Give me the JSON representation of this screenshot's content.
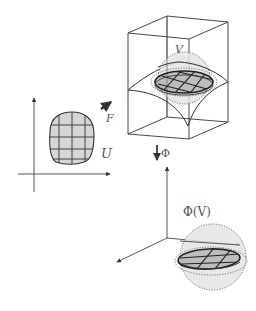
{
  "diagram": {
    "labels": {
      "domain_set": "U",
      "map_F": "F",
      "image_set_V": "V",
      "map_Phi": "Φ",
      "phi_of_V": "Φ(V)"
    },
    "colors": {
      "stroke": "#333333",
      "fill_region": "#d6d6d6",
      "sphere_fill": "#e4e4e4",
      "dotted": "#555555",
      "background": "#ffffff"
    },
    "parts": [
      "2D coordinate axes with grid-patch region U",
      "arrow F to 3D box",
      "3D box with curved surface containing patch V inside dotted sphere",
      "arrow Φ downward",
      "3D coordinate axes with flattened patch Φ(V) inside dotted sphere"
    ]
  }
}
